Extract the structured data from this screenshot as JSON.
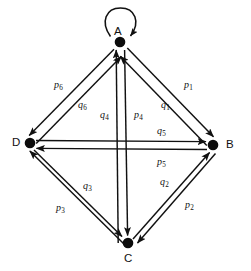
{
  "figure": {
    "type": "directed-graph",
    "background_color": "#ffffff",
    "stroke_color": "#111111"
  },
  "nodes": [
    {
      "id": "A",
      "label": "A",
      "x": 120,
      "y": 42,
      "label_x": 114,
      "label_y": 26,
      "label_position": "above"
    },
    {
      "id": "B",
      "label": "B",
      "x": 213,
      "y": 145,
      "label_x": 226,
      "label_y": 140,
      "label_position": "right"
    },
    {
      "id": "C",
      "label": "C",
      "x": 128,
      "y": 243,
      "label_x": 124,
      "label_y": 253,
      "label_position": "below"
    },
    {
      "id": "D",
      "label": "D",
      "x": 30,
      "y": 143,
      "label_x": 12,
      "label_y": 138,
      "label_position": "left"
    }
  ],
  "edges": [
    {
      "id": "loop-a",
      "from": "A",
      "to": "A",
      "label": "",
      "sub": "",
      "kind": "self-loop"
    },
    {
      "id": "edge-p1",
      "from": "A",
      "to": "B",
      "label": "p",
      "sub": "1",
      "label_x": 184,
      "label_y": 80,
      "kind": "straight"
    },
    {
      "id": "edge-q1",
      "from": "B",
      "to": "A",
      "label": "q",
      "sub": "1",
      "label_x": 161,
      "label_y": 100,
      "kind": "straight"
    },
    {
      "id": "edge-p2",
      "from": "B",
      "to": "C",
      "label": "p",
      "sub": "2",
      "label_x": 185,
      "label_y": 200,
      "kind": "straight"
    },
    {
      "id": "edge-q2",
      "from": "C",
      "to": "B",
      "label": "q",
      "sub": "2",
      "label_x": 160,
      "label_y": 177,
      "kind": "straight"
    },
    {
      "id": "edge-p3",
      "from": "C",
      "to": "D",
      "label": "p",
      "sub": "3",
      "label_x": 56,
      "label_y": 203,
      "kind": "straight"
    },
    {
      "id": "edge-q3",
      "from": "D",
      "to": "C",
      "label": "q",
      "sub": "3",
      "label_x": 83,
      "label_y": 181,
      "kind": "straight"
    },
    {
      "id": "edge-p4",
      "from": "A",
      "to": "C",
      "label": "p",
      "sub": "4",
      "label_x": 134,
      "label_y": 110,
      "kind": "straight"
    },
    {
      "id": "edge-q4",
      "from": "C",
      "to": "A",
      "label": "q",
      "sub": "4",
      "label_x": 104,
      "label_y": 110,
      "kind": "straight"
    },
    {
      "id": "edge-q5",
      "from": "D",
      "to": "B",
      "label": "q",
      "sub": "5",
      "label_x": 157,
      "label_y": 128,
      "kind": "straight"
    },
    {
      "id": "edge-p5",
      "from": "B",
      "to": "D",
      "label": "p",
      "sub": "5",
      "label_x": 157,
      "label_y": 157,
      "kind": "straight"
    },
    {
      "id": "edge-p6",
      "from": "A",
      "to": "D",
      "label": "p",
      "sub": "6",
      "label_x": 54,
      "label_y": 80,
      "kind": "straight"
    },
    {
      "id": "edge-q6",
      "from": "D",
      "to": "A",
      "label": "q",
      "sub": "6",
      "label_x": 78,
      "label_y": 100,
      "kind": "straight"
    }
  ]
}
